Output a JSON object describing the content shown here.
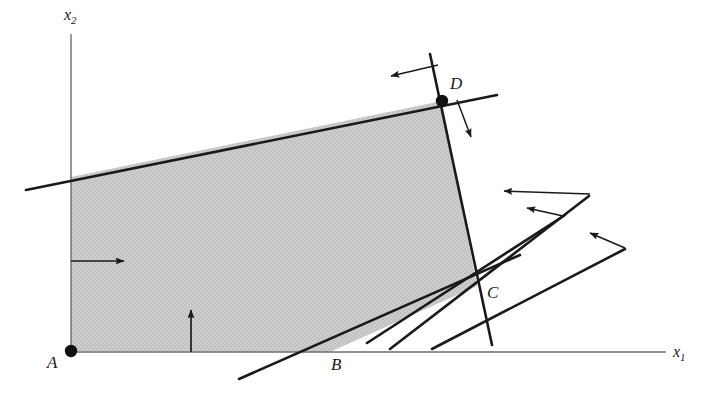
{
  "figure": {
    "kind": "linear-programming-feasible-region-diagram",
    "background_color": "#ffffff",
    "line_color": "#1a1a1a",
    "fill_color": "#c9c9c9",
    "fill_label": "feasible region shading"
  },
  "axes": {
    "x_axis": {
      "name": "x1-axis",
      "label_base": "x",
      "label_sub": "1",
      "label_text": "x1",
      "start": [
        71,
        352
      ],
      "end": [
        666,
        352
      ]
    },
    "y_axis": {
      "name": "x2-axis",
      "label_base": "x",
      "label_sub": "2",
      "label_text": "x2",
      "start": [
        71,
        352
      ],
      "end": [
        71,
        34
      ]
    }
  },
  "vertices": [
    {
      "id": "A",
      "label": "A",
      "x": 71,
      "y": 351,
      "dot": true,
      "label_x": 47,
      "label_y": 353
    },
    {
      "id": "B",
      "label": "B",
      "x": 330,
      "y": 352,
      "dot": false,
      "label_x": 331,
      "label_y": 355
    },
    {
      "id": "C",
      "label": "C",
      "x": 477,
      "y": 286,
      "dot": false,
      "label_x": 487,
      "label_y": 283
    },
    {
      "id": "D",
      "label": "D",
      "x": 442,
      "y": 101,
      "dot": true,
      "label_x": 450,
      "label_y": 74
    }
  ],
  "region_polygon": [
    [
      71,
      351
    ],
    [
      71,
      177
    ],
    [
      442,
      101
    ],
    [
      477,
      286
    ],
    [
      330,
      352
    ]
  ],
  "constraint_lines": [
    {
      "id": "top-constraint-line",
      "from": [
        26,
        190
      ],
      "to": [
        497,
        95
      ]
    },
    {
      "id": "right-constraint-line-D-C",
      "from": [
        430,
        54
      ],
      "to": [
        492,
        345
      ]
    },
    {
      "id": "bottom-constraint-line-B-C",
      "from": [
        239,
        379
      ],
      "to": [
        520,
        255
      ]
    },
    {
      "id": "c-fan-line-1",
      "from": [
        390,
        349
      ],
      "to": [
        589,
        196
      ]
    },
    {
      "id": "c-fan-line-2",
      "from": [
        367,
        343
      ],
      "to": [
        565,
        215
      ]
    },
    {
      "id": "c-fan-line-3",
      "from": [
        432,
        349
      ],
      "to": [
        625,
        249
      ]
    }
  ],
  "direction_arrows": [
    {
      "id": "arrow-interior-right",
      "from": [
        71,
        261
      ],
      "to": [
        124,
        261
      ]
    },
    {
      "id": "arrow-interior-up",
      "from": [
        191,
        352
      ],
      "to": [
        191,
        310
      ]
    },
    {
      "id": "arrow-from-top-line",
      "from": [
        438,
        65
      ],
      "to": [
        391,
        76
      ]
    },
    {
      "id": "arrow-from-right-line",
      "from": [
        457,
        100
      ],
      "to": [
        471,
        137
      ]
    },
    {
      "id": "arrow-c-fan-1",
      "from": [
        590,
        194
      ],
      "to": [
        504,
        191
      ]
    },
    {
      "id": "arrow-c-fan-2",
      "from": [
        563,
        216
      ],
      "to": [
        527,
        208
      ]
    },
    {
      "id": "arrow-c-fan-3",
      "from": [
        625,
        248
      ],
      "to": [
        590,
        233
      ]
    }
  ]
}
